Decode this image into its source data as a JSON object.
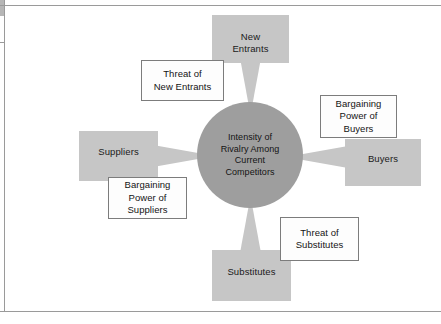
{
  "diagram": {
    "center": {
      "label": "Intensity of\nRivalry Among\nCurrent\nCompetitors",
      "line1": "Intensity of",
      "line2": "Rivalry Among",
      "line3": "Current",
      "line4": "Competitors"
    },
    "forces": [
      {
        "id": "new-entrants",
        "label": "New\nEntrants",
        "position": "top",
        "color": "#c6c6c6"
      },
      {
        "id": "suppliers",
        "label": "Suppliers",
        "position": "left",
        "color": "#c6c6c6"
      },
      {
        "id": "buyers",
        "label": "Buyers",
        "position": "right",
        "color": "#c6c6c6"
      },
      {
        "id": "substitutes",
        "label": "Substitutes",
        "position": "bottom",
        "color": "#c6c6c6"
      }
    ],
    "captions": [
      {
        "id": "threat-new-entrants",
        "label": "Threat of\nNew Entrants",
        "attaches_to": "new-entrants"
      },
      {
        "id": "power-suppliers",
        "label": "Bargaining\nPower of\nSuppliers",
        "attaches_to": "suppliers"
      },
      {
        "id": "power-buyers",
        "label": "Bargaining\nPower of\nBuyers",
        "attaches_to": "buyers"
      },
      {
        "id": "threat-substitutes",
        "label": "Threat of\nSubstitutes",
        "attaches_to": "substitutes"
      }
    ],
    "colors": {
      "force_fill": "#c6c6c6",
      "center_fill": "#9e9e9e",
      "caption_fill": "#fdfdfd",
      "caption_border": "#7c7c7c",
      "rule": "#9a9a9a",
      "text": "#141414",
      "background": "#ffffff"
    }
  }
}
